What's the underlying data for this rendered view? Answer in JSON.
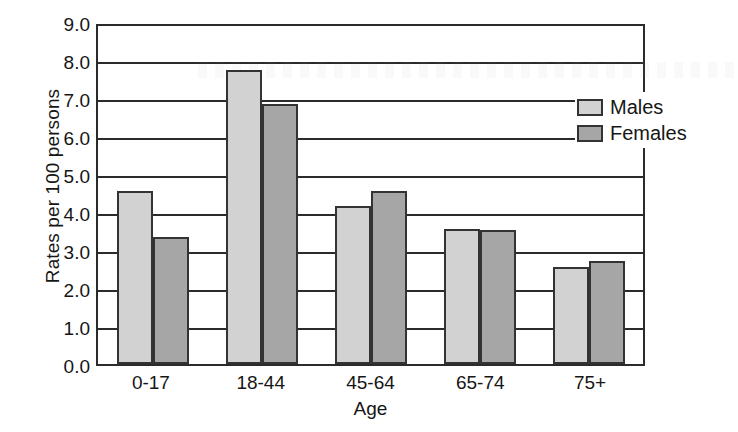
{
  "chart_data": {
    "type": "bar",
    "title": "",
    "xlabel": "Age",
    "ylabel": "Rates per 100 persons",
    "categories": [
      "0-17",
      "18-44",
      "45-64",
      "65-74",
      "75+"
    ],
    "series": [
      {
        "name": "Males",
        "color": "#d2d2d2",
        "values": [
          4.55,
          7.75,
          4.15,
          3.55,
          2.55
        ]
      },
      {
        "name": "Females",
        "color": "#a6a6a6",
        "values": [
          3.35,
          6.85,
          4.55,
          3.52,
          2.72
        ]
      }
    ],
    "ylim": [
      0.0,
      9.0
    ],
    "ytick_labels": [
      "9.0",
      "8.0",
      "7.0",
      "6.0",
      "5.0",
      "4.0",
      "3.0",
      "2.0",
      "1.0",
      "0.0"
    ],
    "ytick_values": [
      9.0,
      8.0,
      7.0,
      6.0,
      5.0,
      4.0,
      3.0,
      2.0,
      1.0,
      0.0
    ],
    "grid": true,
    "grid_axis": "y",
    "legend_position": "upper-right-inside",
    "bar_border_color": "#333333",
    "frame_color": "#2b2b2b"
  },
  "legend": {
    "items": [
      {
        "label": "Males"
      },
      {
        "label": "Females"
      }
    ]
  }
}
